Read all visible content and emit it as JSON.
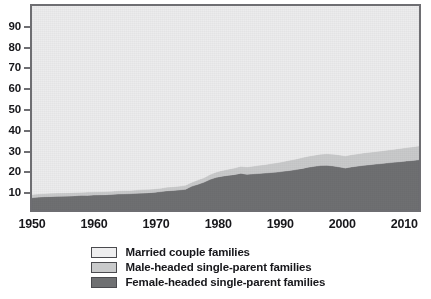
{
  "chart_data": {
    "type": "area",
    "stacked": true,
    "title": "",
    "subtitle": "",
    "xlabel": "",
    "ylabel": "",
    "xlim": [
      1950,
      2013
    ],
    "ylim": [
      0,
      100
    ],
    "grid": false,
    "legend_position": "bottom-center",
    "x_ticks": [
      "1950",
      "1960",
      "1970",
      "1980",
      "1990",
      "2000",
      "2010"
    ],
    "x_tick_values": [
      1950,
      1960,
      1970,
      1980,
      1990,
      2000,
      2010
    ],
    "y_ticks": [
      "10",
      "20",
      "30",
      "40",
      "50",
      "60",
      "70",
      "80",
      "90"
    ],
    "y_tick_values": [
      10,
      20,
      30,
      40,
      50,
      60,
      70,
      80,
      90
    ],
    "x": [
      1950,
      1951,
      1952,
      1953,
      1954,
      1955,
      1956,
      1957,
      1958,
      1959,
      1960,
      1961,
      1962,
      1963,
      1964,
      1965,
      1966,
      1967,
      1968,
      1969,
      1970,
      1971,
      1972,
      1973,
      1974,
      1975,
      1976,
      1977,
      1978,
      1979,
      1980,
      1981,
      1982,
      1983,
      1984,
      1985,
      1986,
      1987,
      1988,
      1989,
      1990,
      1991,
      1992,
      1993,
      1994,
      1995,
      1996,
      1997,
      1998,
      1999,
      2000,
      2001,
      2002,
      2003,
      2004,
      2005,
      2006,
      2007,
      2008,
      2009,
      2010,
      2011,
      2012,
      2013
    ],
    "series": [
      {
        "name": "Female-headed single-parent families",
        "color": "#6f7072",
        "values": [
          6.0,
          6.3,
          6.5,
          6.6,
          6.7,
          6.8,
          6.9,
          7.0,
          7.1,
          7.2,
          7.3,
          7.4,
          7.5,
          7.6,
          7.8,
          7.9,
          8.0,
          8.2,
          8.4,
          8.5,
          8.7,
          9.0,
          9.4,
          9.6,
          9.8,
          10.2,
          11.6,
          12.6,
          13.6,
          15.0,
          16.0,
          16.6,
          17.0,
          17.4,
          18.0,
          17.5,
          17.7,
          17.9,
          18.1,
          18.4,
          18.6,
          19.0,
          19.4,
          19.8,
          20.4,
          21.0,
          21.4,
          21.8,
          21.9,
          21.6,
          21.1,
          20.6,
          21.1,
          21.5,
          21.9,
          22.2,
          22.5,
          22.8,
          23.1,
          23.4,
          23.7,
          24.0,
          24.3,
          24.6
        ]
      },
      {
        "name": "Male-headed single-parent families",
        "color": "#c9cacb",
        "values": [
          1.6,
          1.6,
          1.6,
          1.6,
          1.6,
          1.6,
          1.6,
          1.6,
          1.6,
          1.6,
          1.6,
          1.6,
          1.6,
          1.6,
          1.6,
          1.6,
          1.6,
          1.6,
          1.6,
          1.7,
          1.7,
          1.7,
          1.8,
          1.8,
          1.9,
          1.9,
          2.0,
          2.1,
          2.2,
          2.4,
          2.6,
          2.8,
          3.0,
          3.2,
          3.4,
          3.6,
          3.8,
          4.0,
          4.2,
          4.4,
          4.6,
          4.8,
          5.0,
          5.2,
          5.3,
          5.4,
          5.5,
          5.6,
          5.7,
          5.8,
          5.9,
          5.9,
          6.0,
          6.0,
          6.1,
          6.1,
          6.2,
          6.2,
          6.3,
          6.4,
          6.5,
          6.6,
          6.7,
          6.8
        ]
      },
      {
        "name": "Married couple families",
        "color": "#ececed",
        "values": [
          92.4,
          92.1,
          91.9,
          91.8,
          91.7,
          91.6,
          91.5,
          91.4,
          91.3,
          91.2,
          91.1,
          91.0,
          90.9,
          90.8,
          90.6,
          90.5,
          90.4,
          90.2,
          90.0,
          89.8,
          89.6,
          89.3,
          88.8,
          88.6,
          88.3,
          87.9,
          86.4,
          85.3,
          84.2,
          82.6,
          81.4,
          80.6,
          80.0,
          79.4,
          78.6,
          78.9,
          78.5,
          78.1,
          77.7,
          77.2,
          76.8,
          76.2,
          75.6,
          75.0,
          74.3,
          73.6,
          73.1,
          72.6,
          72.4,
          72.6,
          73.0,
          73.5,
          72.9,
          72.5,
          72.0,
          71.7,
          71.3,
          71.0,
          70.6,
          70.2,
          69.8,
          69.4,
          69.0,
          68.6
        ]
      }
    ]
  },
  "legend": {
    "items": [
      {
        "label": "Married couple families",
        "color": "#eeeeef"
      },
      {
        "label": "Male-headed single-parent families",
        "color": "#c9cacb"
      },
      {
        "label": "Female-headed single-parent families",
        "color": "#6f7072"
      }
    ]
  },
  "axes": {
    "frame_color": "#6e6e72"
  }
}
